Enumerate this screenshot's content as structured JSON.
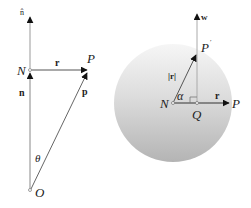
{
  "left_figure": {
    "labels": {
      "n_hat": "n̂",
      "N": "N",
      "r": "r",
      "P": "P",
      "n": "n",
      "p": "p",
      "theta": "θ",
      "O": "O"
    }
  },
  "right_figure": {
    "labels": {
      "w": "w",
      "P_prime": "P",
      "prime_mark": "′",
      "r_norm": "|r|",
      "N": "N",
      "alpha": "α",
      "r": "r",
      "P": "P",
      "Q": "Q"
    },
    "colors": {
      "disc_light": "#f4f4f4",
      "disc_dark": "#b8b8b8"
    }
  }
}
